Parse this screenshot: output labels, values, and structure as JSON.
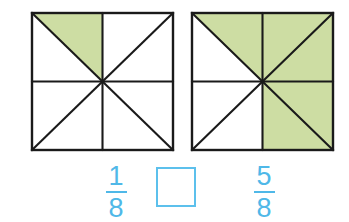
{
  "page": {
    "background_color": "#ffffff"
  },
  "colors": {
    "shade_green": "#cddda3",
    "outline_black": "#1a1a1a",
    "accent_blue": "#4fb8e8",
    "box_border_blue": "#5cc0ec",
    "white": "#ffffff"
  },
  "figures": [
    {
      "name": "left-figure",
      "total_parts": 8,
      "shaded_parts": 1,
      "fraction_text": "1/8",
      "shaded_segments": [
        "top-left-upper"
      ],
      "segments": [
        {
          "id": "top-left-upper",
          "shaded": true
        },
        {
          "id": "top-left-lower",
          "shaded": false
        },
        {
          "id": "top-right-upper",
          "shaded": false
        },
        {
          "id": "top-right-lower",
          "shaded": false
        },
        {
          "id": "bottom-right-upper",
          "shaded": false
        },
        {
          "id": "bottom-right-lower",
          "shaded": false
        },
        {
          "id": "bottom-left-upper",
          "shaded": false
        },
        {
          "id": "bottom-left-lower",
          "shaded": false
        }
      ]
    },
    {
      "name": "right-figure",
      "total_parts": 8,
      "shaded_parts": 5,
      "fraction_text": "5/8",
      "shaded_segments": [
        "top-left-upper",
        "top-right-upper",
        "top-right-lower",
        "bottom-right-upper",
        "bottom-right-lower"
      ],
      "segments": [
        {
          "id": "top-left-upper",
          "shaded": true
        },
        {
          "id": "top-left-lower",
          "shaded": false
        },
        {
          "id": "top-right-upper",
          "shaded": true
        },
        {
          "id": "top-right-lower",
          "shaded": true
        },
        {
          "id": "bottom-right-upper",
          "shaded": true
        },
        {
          "id": "bottom-right-lower",
          "shaded": true
        },
        {
          "id": "bottom-left-upper",
          "shaded": false
        },
        {
          "id": "bottom-left-lower",
          "shaded": false
        }
      ]
    }
  ],
  "answer_row": {
    "left_fraction": {
      "numerator": "1",
      "denominator": "8"
    },
    "right_fraction": {
      "numerator": "5",
      "denominator": "8"
    },
    "comparison_box": {
      "value": "",
      "placeholder": ""
    }
  }
}
